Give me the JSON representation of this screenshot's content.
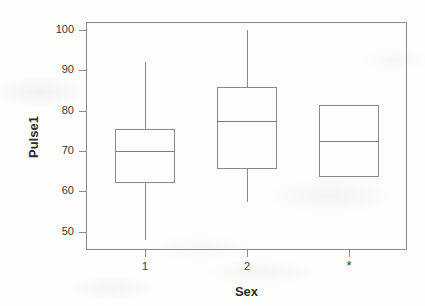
{
  "chart_data": {
    "type": "box",
    "title": "",
    "xlabel": "Sex",
    "ylabel": "Pulse1",
    "grid": false,
    "legend": "none",
    "ylim": [
      45.5,
      102
    ],
    "yticks": [
      50,
      60,
      70,
      80,
      90,
      100
    ],
    "ytick_labels": [
      "50",
      "60",
      "70",
      "80",
      "90",
      "100"
    ],
    "categories": [
      "1",
      "2",
      "*"
    ],
    "xtick_labels": [
      "1",
      "2",
      "*"
    ],
    "boxes": [
      {
        "category": "1",
        "whisker_low": 48,
        "q1": 62,
        "median": 70,
        "q3": 75.5,
        "whisker_high": 92,
        "has_whiskers": true
      },
      {
        "category": "2",
        "whisker_low": 57.5,
        "q1": 65.5,
        "median": 77.5,
        "q3": 86,
        "whisker_high": 100,
        "has_whiskers": true
      },
      {
        "category": "*",
        "whisker_low": null,
        "q1": 63.5,
        "median": 72.5,
        "q3": 81.5,
        "whisker_high": null,
        "has_whiskers": false
      }
    ]
  },
  "style": {
    "line_color": "#8b8b8b",
    "text_color": "#3a3a3a",
    "title_color": "#2c2c2c",
    "background": "#fdfdfc"
  }
}
